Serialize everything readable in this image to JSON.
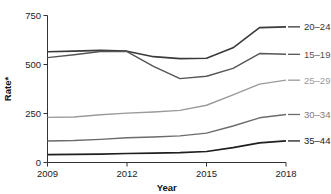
{
  "chart_data": {
    "type": "line",
    "title": "",
    "xlabel": "Year",
    "ylabel": "Rate*",
    "x": [
      2009,
      2010,
      2011,
      2012,
      2013,
      2014,
      2015,
      2016,
      2017,
      2018
    ],
    "xlim": [
      2009,
      2018
    ],
    "ylim": [
      0,
      750
    ],
    "xticks": [
      "2009",
      "2012",
      "2015",
      "2018"
    ],
    "xtick_values": [
      2009,
      2012,
      2015,
      2018
    ],
    "yticks": [
      "0",
      "250",
      "500",
      "750"
    ],
    "ytick_values": [
      0,
      250,
      500,
      750
    ],
    "grid": false,
    "legend_position": "right-inline",
    "series": [
      {
        "name": "20–24",
        "color": "#3a3a3a",
        "width": 1.6,
        "label_color": "#333333",
        "values": [
          565,
          568,
          572,
          568,
          540,
          530,
          532,
          585,
          688,
          692
        ]
      },
      {
        "name": "15–19",
        "color": "#555555",
        "width": 1.4,
        "label_color": "#555555",
        "values": [
          535,
          550,
          566,
          566,
          490,
          428,
          440,
          480,
          556,
          552
        ]
      },
      {
        "name": "25–29",
        "color": "#9a9a9a",
        "width": 1.4,
        "label_color": "#9a9a9a",
        "values": [
          230,
          232,
          244,
          252,
          258,
          266,
          292,
          345,
          400,
          420
        ]
      },
      {
        "name": "30–34",
        "color": "#6b6b6b",
        "width": 1.4,
        "label_color": "#7a7a7a",
        "values": [
          110,
          112,
          118,
          126,
          130,
          136,
          150,
          186,
          228,
          245
        ]
      },
      {
        "name": "35–44",
        "color": "#1f1f1f",
        "width": 1.7,
        "label_color": "#222222",
        "values": [
          40,
          41,
          43,
          46,
          48,
          50,
          56,
          76,
          100,
          110
        ]
      }
    ],
    "ylabel_footnote": "*"
  }
}
